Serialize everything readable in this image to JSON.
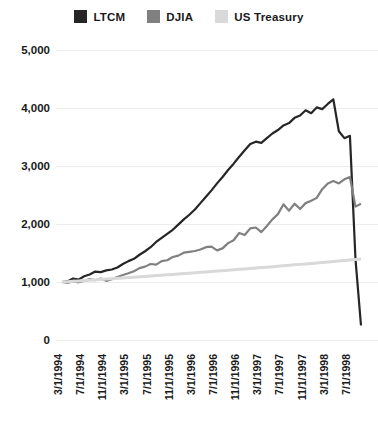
{
  "legend": {
    "position": "top-center",
    "items": [
      {
        "label": "LTCM",
        "color": "#262626",
        "swatch_name": "legend-swatch-ltcm"
      },
      {
        "label": "DJIA",
        "color": "#808080",
        "swatch_name": "legend-swatch-djia"
      },
      {
        "label": "US Treasury",
        "color": "#d9d9d9",
        "swatch_name": "legend-swatch-us-treasury"
      }
    ]
  },
  "chart_data": {
    "type": "line",
    "title": "",
    "subtitle": "",
    "xlabel": "",
    "ylabel": "",
    "ylim": [
      0,
      5000
    ],
    "yticks": [
      0,
      1000,
      2000,
      3000,
      4000,
      5000
    ],
    "ytick_labels": [
      "0",
      "1,000",
      "2,000",
      "3,000",
      "4,000",
      "5,000"
    ],
    "grid": true,
    "grid_axis": "y",
    "legend_position": "top-center",
    "xtick_labels": [
      "3/1/1994",
      "7/1/1994",
      "11/1/1994",
      "3/1/1995",
      "7/1/1995",
      "11/1/1995",
      "3/1/1996",
      "7/1/1996",
      "11/1/1996",
      "3/1/1997",
      "7/1/1997",
      "11/1/1997",
      "3/1/1998",
      "7/1/1998"
    ],
    "x": [
      "3/1/1994",
      "4/1/1994",
      "5/1/1994",
      "6/1/1994",
      "7/1/1994",
      "8/1/1994",
      "9/1/1994",
      "10/1/1994",
      "11/1/1994",
      "12/1/1994",
      "1/1/1995",
      "2/1/1995",
      "3/1/1995",
      "4/1/1995",
      "5/1/1995",
      "6/1/1995",
      "7/1/1995",
      "8/1/1995",
      "9/1/1995",
      "10/1/1995",
      "11/1/1995",
      "12/1/1995",
      "1/1/1996",
      "2/1/1996",
      "3/1/1996",
      "4/1/1996",
      "5/1/1996",
      "6/1/1996",
      "7/1/1996",
      "8/1/1996",
      "9/1/1996",
      "10/1/1996",
      "11/1/1996",
      "12/1/1996",
      "1/1/1997",
      "2/1/1997",
      "3/1/1997",
      "4/1/1997",
      "5/1/1997",
      "6/1/1997",
      "7/1/1997",
      "8/1/1997",
      "9/1/1997",
      "10/1/1997",
      "11/1/1997",
      "12/1/1997",
      "1/1/1998",
      "2/1/1998",
      "3/1/1998",
      "4/1/1998",
      "5/1/1998",
      "6/1/1998",
      "7/1/1998",
      "8/1/1998",
      "9/1/1998"
    ],
    "series": [
      {
        "name": "LTCM",
        "color": "#262626",
        "values": [
          1000,
          1010,
          1060,
          1040,
          1100,
          1130,
          1180,
          1170,
          1200,
          1215,
          1250,
          1310,
          1360,
          1400,
          1470,
          1530,
          1600,
          1690,
          1760,
          1830,
          1900,
          1990,
          2080,
          2160,
          2250,
          2360,
          2470,
          2580,
          2700,
          2810,
          2930,
          3040,
          3160,
          3270,
          3380,
          3420,
          3400,
          3480,
          3560,
          3620,
          3700,
          3740,
          3830,
          3870,
          3960,
          3910,
          4010,
          3980,
          4070,
          4150,
          3600,
          3480,
          3520,
          1400,
          250
        ]
      },
      {
        "name": "DJIA",
        "color": "#808080",
        "values": [
          1000,
          985,
          1010,
          995,
          1020,
          1050,
          1030,
          1060,
          1020,
          1050,
          1085,
          1120,
          1150,
          1185,
          1240,
          1265,
          1310,
          1300,
          1360,
          1375,
          1430,
          1455,
          1505,
          1520,
          1535,
          1560,
          1600,
          1610,
          1545,
          1580,
          1670,
          1720,
          1845,
          1810,
          1925,
          1940,
          1860,
          1965,
          2080,
          2170,
          2340,
          2230,
          2350,
          2260,
          2360,
          2400,
          2450,
          2600,
          2700,
          2740,
          2700,
          2770,
          2810,
          2300,
          2350
        ]
      },
      {
        "name": "US Treasury",
        "color": "#d9d9d9",
        "values": [
          1000,
          1006,
          1012,
          1018,
          1025,
          1031,
          1037,
          1044,
          1050,
          1057,
          1063,
          1070,
          1076,
          1083,
          1090,
          1096,
          1103,
          1110,
          1117,
          1124,
          1131,
          1138,
          1145,
          1152,
          1159,
          1166,
          1173,
          1181,
          1188,
          1195,
          1203,
          1210,
          1218,
          1225,
          1233,
          1241,
          1248,
          1256,
          1264,
          1272,
          1280,
          1288,
          1296,
          1304,
          1312,
          1320,
          1328,
          1337,
          1345,
          1353,
          1362,
          1370,
          1379,
          1387,
          1396
        ]
      }
    ]
  }
}
